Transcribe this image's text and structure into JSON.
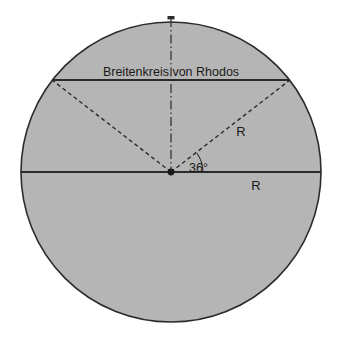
{
  "figure": {
    "name": "earth-cross-section-rhodes",
    "background_color": "#ffffff",
    "fill_color": "#b5b5b5",
    "stroke_color": "#1a1a1a"
  },
  "labels": {
    "latitude_circle": "Breitenkreis von Rhodos",
    "radius_diagonal": "R",
    "radius_horizontal": "R",
    "angle": "36°"
  },
  "geometry": {
    "circle": {
      "center_x": 171,
      "center_y": 172,
      "radius": 150
    },
    "chord_y": 80,
    "chord_left_x": 52,
    "chord_right_x": 290,
    "equator_y": 172,
    "angle_degrees": 36
  }
}
